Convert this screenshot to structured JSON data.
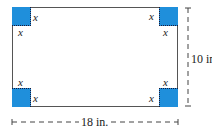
{
  "figure": {
    "corner_label": "x",
    "width_label": "18 in.",
    "height_label": "10 in.",
    "colors": {
      "square_fill": "#1f8fdb",
      "outline": "#555555",
      "dim_line": "#444444"
    }
  }
}
